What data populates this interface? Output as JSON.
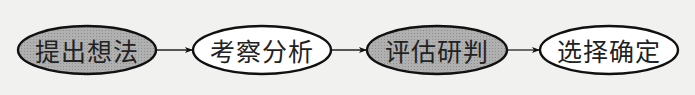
{
  "diagram": {
    "type": "flowchart",
    "direction": "left-to-right",
    "nodes": [
      {
        "id": "n1",
        "label": "提出想法",
        "fill": "#a9a9a9",
        "shape": "ellipse"
      },
      {
        "id": "n2",
        "label": "考察分析",
        "fill": "#ffffff",
        "shape": "ellipse"
      },
      {
        "id": "n3",
        "label": "评估研判",
        "fill": "#a9a9a9",
        "shape": "ellipse"
      },
      {
        "id": "n4",
        "label": "选择确定",
        "fill": "#ffffff",
        "shape": "ellipse"
      }
    ],
    "edges": [
      {
        "from": "n1",
        "to": "n2"
      },
      {
        "from": "n2",
        "to": "n3"
      },
      {
        "from": "n3",
        "to": "n4"
      }
    ],
    "colors": {
      "stroke": "#111111",
      "shaded_fill": "#a9a9a9",
      "plain_fill": "#ffffff",
      "background": "#f1f1ef"
    }
  }
}
